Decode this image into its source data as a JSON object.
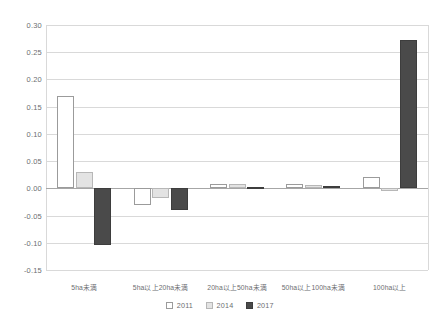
{
  "chart_data": {
    "type": "bar",
    "title": "",
    "subtitle": "",
    "xlabel": "",
    "ylabel": "",
    "ylim": [
      -0.15,
      0.3
    ],
    "ytick_step": 0.05,
    "yticks": [
      "0.30",
      "0.25",
      "0.20",
      "0.15",
      "0.10",
      "0.05",
      "0.00",
      "-0.05",
      "-0.10",
      "-0.15"
    ],
    "ytick_values": [
      0.3,
      0.25,
      0.2,
      0.15,
      0.1,
      0.05,
      0.0,
      -0.05,
      -0.1,
      -0.15
    ],
    "grid": true,
    "legend_position": "bottom",
    "categories": [
      "5ha未満",
      "5ha以上20ha未満",
      "20ha以上50ha未満",
      "50ha以上100ha未満",
      "100ha以上"
    ],
    "series": [
      {
        "name": "2011",
        "color": "#ffffff",
        "border": "#9b9b9b",
        "values": [
          0.17,
          -0.03,
          0.008,
          0.008,
          0.02
        ]
      },
      {
        "name": "2014",
        "color": "#e3e3e3",
        "border": "#b7b7b7",
        "values": [
          0.03,
          -0.018,
          0.008,
          0.006,
          -0.005
        ]
      },
      {
        "name": "2017",
        "color": "#4a4a4a",
        "border": "#3d3d3d",
        "values": [
          -0.105,
          -0.04,
          0.003,
          0.005,
          0.272
        ]
      }
    ]
  },
  "legend": {
    "items": [
      {
        "label": "2011"
      },
      {
        "label": "2014"
      },
      {
        "label": "2017"
      }
    ]
  },
  "colors": {
    "gridline": "#d9d9d9",
    "zero_line": "#a6a6a6",
    "text": "#6d6e71",
    "background": "#ffffff"
  }
}
